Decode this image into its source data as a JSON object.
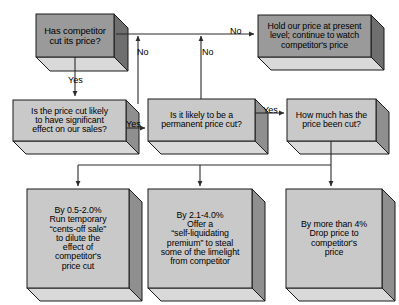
{
  "diagram": {
    "colors": {
      "front_light": "#c9c9c9",
      "front_dark": "#9a9a9a",
      "side": "#8f8f8f",
      "side_dark": "#6f6f6f",
      "bottom": "#d9d9d9",
      "outline": "#1a1a1a",
      "line": "#2b2b2b",
      "text": "#000000",
      "background": "#ffffff"
    },
    "nodes": [
      {
        "id": "n1",
        "name": "has-competitor-cut-price",
        "text": "Has competitor\ncut its price?",
        "shade": "dark",
        "x": 36,
        "y": 14,
        "w": 78,
        "h": 43,
        "d": 14,
        "font": 9.4
      },
      {
        "id": "n2",
        "name": "significant-effect-on-sales",
        "text": "Is the price cut likely\nto have significant\neffect on our sales?",
        "shade": "light",
        "x": 13,
        "y": 100,
        "w": 113,
        "h": 41,
        "d": 13,
        "font": 8.8
      },
      {
        "id": "n3",
        "name": "hold-our-price",
        "text": "Hold our price at present\nlevel; continue to watch\ncompetitor's price",
        "shade": "dark",
        "x": 258,
        "y": 15,
        "w": 113,
        "h": 42,
        "d": 13,
        "font": 8.8
      },
      {
        "id": "n4",
        "name": "permanent-price-cut",
        "text": "Is it likely to be a\npermanent price cut?",
        "shade": "light",
        "x": 148,
        "y": 99,
        "w": 107,
        "h": 42,
        "d": 13,
        "font": 8.8
      },
      {
        "id": "n5",
        "name": "how-much-cut",
        "text": "How much has the\nprice been cut?",
        "shade": "light",
        "x": 287,
        "y": 99,
        "w": 89,
        "h": 42,
        "d": 13,
        "font": 8.8
      },
      {
        "id": "n6",
        "name": "outcome-cents-off-sale",
        "text": "By 0.5-2.0%\nRun temporary\n“cents-off sale”\nto dilute the\neffect of\ncompetitor's\nprice cut",
        "shade": "light",
        "x": 27,
        "y": 189,
        "w": 102,
        "h": 99,
        "d": 13,
        "font": 8.8
      },
      {
        "id": "n7",
        "name": "outcome-self-liquidating-premium",
        "text": "By 2.1-4.0%\nOffer a\n“self-liquidating\npremium” to steal\nsome of the limelight\nfrom competitor",
        "shade": "light",
        "x": 148,
        "y": 189,
        "w": 104,
        "h": 99,
        "d": 13,
        "font": 8.8
      },
      {
        "id": "n8",
        "name": "outcome-drop-price",
        "text": "By more than 4%\nDrop price to\ncompetitor's\nprice",
        "shade": "light",
        "x": 286,
        "y": 189,
        "w": 96,
        "h": 99,
        "d": 13,
        "font": 8.8
      }
    ],
    "edge_labels": [
      {
        "id": "l1",
        "name": "edge-label-yes-1to2",
        "text": "Yes",
        "x": 68,
        "y": 76
      },
      {
        "id": "l2",
        "name": "edge-label-no-2",
        "text": "No",
        "x": 137,
        "y": 48
      },
      {
        "id": "l3",
        "name": "edge-label-no-4",
        "text": "No",
        "x": 202,
        "y": 48
      },
      {
        "id": "l4",
        "name": "edge-label-no-1to3",
        "text": "No",
        "x": 230,
        "y": 27
      },
      {
        "id": "l5",
        "name": "edge-label-yes-2to4",
        "text": "Yes",
        "x": 126,
        "y": 120
      },
      {
        "id": "l6",
        "name": "edge-label-yes-4to5",
        "text": "Yes",
        "x": 263,
        "y": 106
      }
    ]
  }
}
